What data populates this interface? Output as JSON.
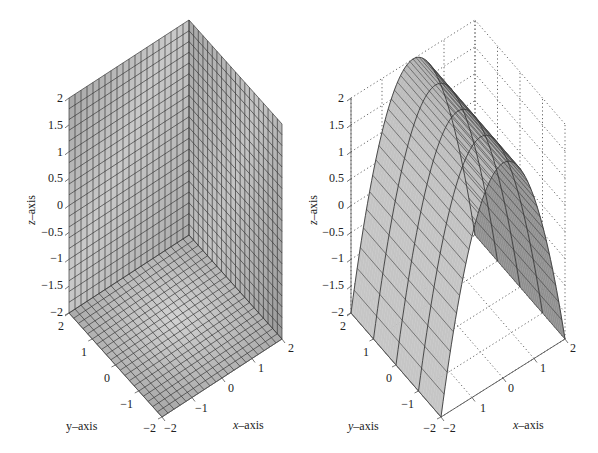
{
  "chart_data": [
    {
      "type": "surface3d",
      "panel": "left",
      "title": "",
      "description": "Three orthogonal planes (box corner): back walls at x=2 and y=2 and floor at z=-2, rendered with gray shaded mesh",
      "xlabel": "x-axis",
      "ylabel": "y-axis",
      "zlabel": "z-axis",
      "xlim": [
        -2,
        2
      ],
      "ylim": [
        -2,
        2
      ],
      "zlim": [
        -2,
        2
      ],
      "xticks": [
        "-2",
        "-1",
        "0",
        "1",
        "2"
      ],
      "yticks": [
        "-2",
        "-1",
        "0",
        "1",
        "2"
      ],
      "zticks": [
        "-2",
        "-1.5",
        "-1",
        "-0.5",
        "0",
        "0.5",
        "1",
        "1.5",
        "2"
      ],
      "grid": false,
      "mesh_divisions": 20,
      "surface_color": "#b4b4b4",
      "edge_color": "#3a3a3a"
    },
    {
      "type": "surface3d",
      "panel": "right",
      "title": "",
      "description": "Parabolic cylinder z = 2 - 4*x^2/... (arch along y), gray shaded mesh with dotted box grid",
      "equation": "z = 2 - x^2 (scaled to span z from -2 to 2 over x in [-2,2])",
      "xlabel": "x-axis",
      "ylabel": "y-axis",
      "zlabel": "z-axis",
      "xlim": [
        -2,
        2
      ],
      "ylim": [
        -2,
        2
      ],
      "zlim": [
        -2,
        2
      ],
      "xticks": [
        "-2",
        "1",
        "0",
        "1",
        "2"
      ],
      "yticks": [
        "-2",
        "-1",
        "0",
        "1",
        "2"
      ],
      "zticks": [
        "-2",
        "-1.5",
        "-1",
        "-0.5",
        "0",
        "0.5",
        "1",
        "1.5",
        "2"
      ],
      "grid": true,
      "grid_style": "dotted",
      "surface_color": "#b4b4b4",
      "edge_color": "#3a3a3a"
    }
  ],
  "panels": {
    "left": {
      "xlabel": "x–axis",
      "ylabel": "y–axis",
      "zlabel": "z–axis",
      "xticks": [
        "−2",
        "−1",
        "0",
        "1",
        "2"
      ],
      "yticks": [
        "−2",
        "−1",
        "0",
        "1",
        "2"
      ],
      "zticks": [
        "−2",
        "−1.5",
        "−1",
        "−0.5",
        "0",
        "0.5",
        "1",
        "1.5",
        "2"
      ]
    },
    "right": {
      "xlabel": "x–axis",
      "ylabel": "y–axis",
      "zlabel": "z–axis",
      "xticks": [
        "−2",
        "1",
        "0",
        "1",
        "2"
      ],
      "yticks": [
        "−2",
        "−1",
        "0",
        "1",
        "2"
      ],
      "zticks": [
        "−2",
        "−1.5",
        "−1",
        "−0.5",
        "0",
        "0.5",
        "1",
        "1.5",
        "2"
      ]
    }
  },
  "colors": {
    "surface_light": "#cfcfcf",
    "surface_mid": "#b0b0b0",
    "surface_dark": "#8a8a8a",
    "mesh_line": "#3a3a3a",
    "axis": "#555555",
    "text": "#222222"
  }
}
